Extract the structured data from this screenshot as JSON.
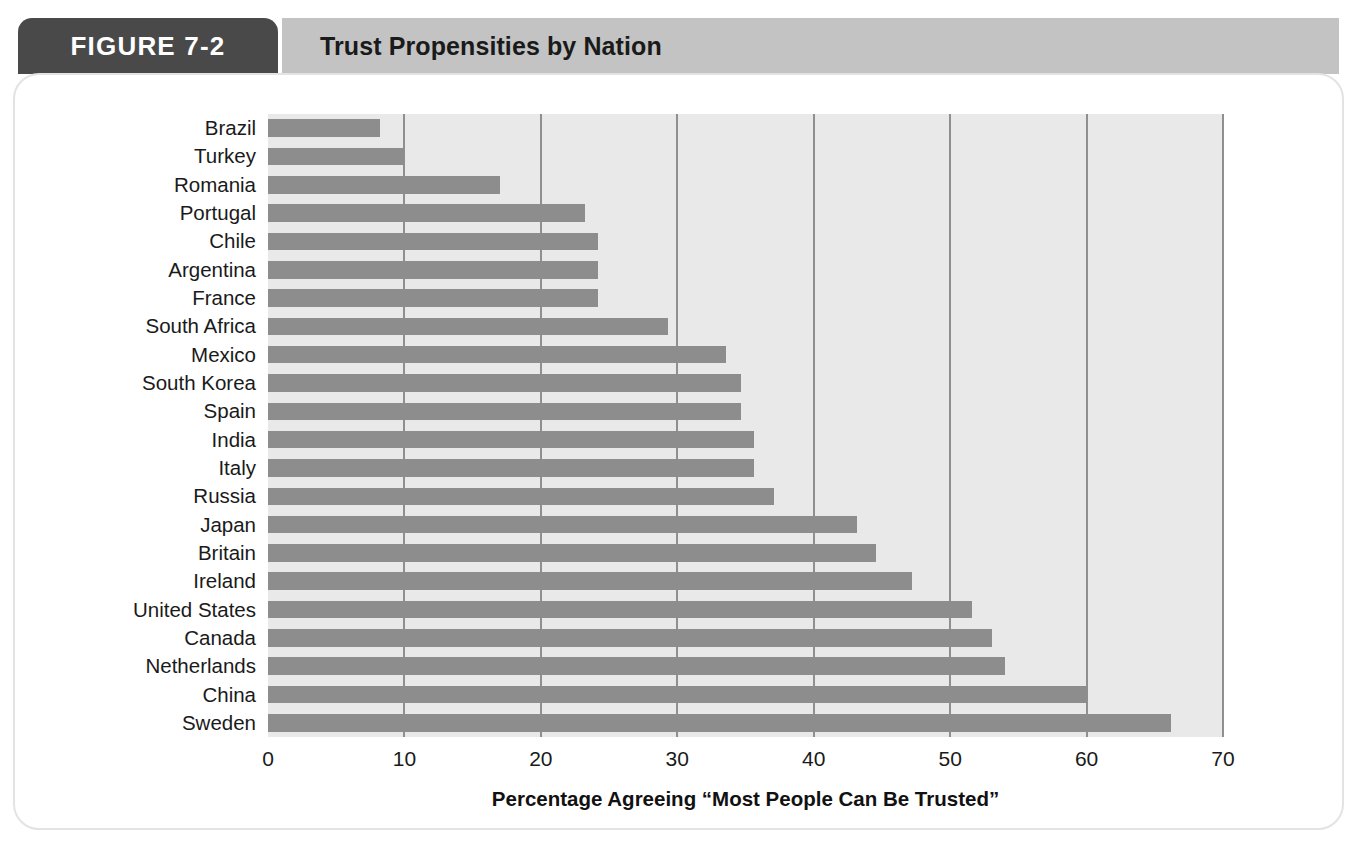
{
  "header": {
    "figure_tab_label": "FIGURE 7-2",
    "figure_title": "Trust Propensities by Nation",
    "tab_color": "#494949",
    "title_bar_color": "#c3c3c3"
  },
  "colors": {
    "bar": "#8d8d8d",
    "plot_background": "#e9e9e9",
    "gridline": "#8f8f8f",
    "card_background": "#ffffff",
    "text": "#1a1a1a"
  },
  "chart_data": {
    "type": "bar",
    "orientation": "horizontal",
    "title": "Trust Propensities by Nation",
    "xlabel": "Percentage Agreeing “Most People Can Be Trusted”",
    "ylabel": "",
    "xlim": [
      0,
      70
    ],
    "xticks": [
      0,
      10,
      20,
      30,
      40,
      50,
      60,
      70
    ],
    "xtick_labels": [
      "0",
      "10",
      "20",
      "30",
      "40",
      "50",
      "60",
      "70"
    ],
    "grid": true,
    "legend": false,
    "categories": [
      "Brazil",
      "Turkey",
      "Romania",
      "Portugal",
      "Chile",
      "Argentina",
      "France",
      "South Africa",
      "Mexico",
      "South Korea",
      "Spain",
      "India",
      "Italy",
      "Russia",
      "Japan",
      "Britain",
      "Ireland",
      "United States",
      "Canada",
      "Netherlands",
      "China",
      "Sweden"
    ],
    "values": [
      8.2,
      10.0,
      17.0,
      23.2,
      24.2,
      24.2,
      24.2,
      29.3,
      33.6,
      34.7,
      34.7,
      35.6,
      35.6,
      37.1,
      43.2,
      44.6,
      47.2,
      51.6,
      53.1,
      54.0,
      60.0,
      66.2
    ]
  }
}
